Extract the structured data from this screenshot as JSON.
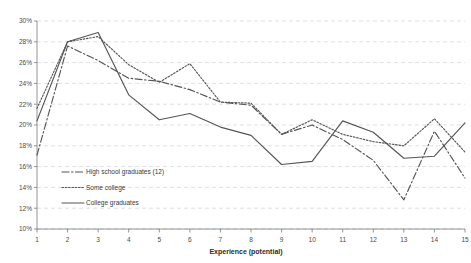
{
  "chart_data": {
    "type": "line",
    "title": "",
    "xlabel": "Experience (potential)",
    "ylabel": "",
    "x": [
      1,
      2,
      3,
      4,
      5,
      6,
      7,
      8,
      9,
      10,
      11,
      12,
      13,
      14,
      15
    ],
    "xtick_labels": [
      "1",
      "2",
      "3",
      "4",
      "5",
      "6",
      "7",
      "8",
      "9",
      "10",
      "11",
      "12",
      "13",
      "14",
      "15"
    ],
    "ytick_labels": [
      "10%",
      "12%",
      "14%",
      "16%",
      "18%",
      "20%",
      "22%",
      "24%",
      "26%",
      "28%",
      "30%"
    ],
    "ytick_values": [
      10,
      12,
      14,
      16,
      18,
      20,
      22,
      24,
      26,
      28,
      30
    ],
    "ylim": [
      10,
      30
    ],
    "xlim": [
      1,
      15
    ],
    "grid": true,
    "legend_position": "inside-lower-left",
    "series": [
      {
        "name": "High school graduates (12)",
        "style": "dash-dot",
        "color": "#555555",
        "values": [
          17.1,
          27.6,
          26.2,
          24.5,
          24.2,
          23.4,
          22.2,
          21.9,
          19.1,
          20.0,
          18.6,
          16.6,
          12.8,
          19.4,
          14.9
        ]
      },
      {
        "name": "Some college",
        "style": "dotted",
        "color": "#555555",
        "values": [
          21.6,
          28.0,
          28.5,
          25.8,
          24.1,
          25.9,
          22.2,
          22.1,
          19.1,
          20.5,
          19.1,
          18.4,
          18.0,
          20.6,
          17.4
        ]
      },
      {
        "name": "College graduates",
        "style": "solid",
        "color": "#555555",
        "values": [
          20.4,
          28.0,
          28.9,
          22.9,
          20.5,
          21.1,
          19.8,
          19.0,
          16.2,
          16.5,
          20.4,
          19.3,
          16.8,
          17.0,
          20.2
        ]
      }
    ]
  },
  "legend": {
    "items": [
      {
        "label": "High school graduates (12)"
      },
      {
        "label": "Some college"
      },
      {
        "label": "College graduates"
      }
    ]
  },
  "axis": {
    "x_title": "Experience (potential)"
  }
}
